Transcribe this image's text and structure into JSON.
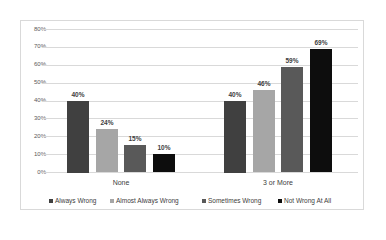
{
  "chart_data": {
    "type": "bar",
    "title": "",
    "xlabel": "",
    "ylabel": "",
    "categories": [
      "None",
      "3 or More"
    ],
    "series": [
      {
        "name": "Always Wrong",
        "color": "#404040",
        "values": [
          40,
          40
        ],
        "labels": [
          "40%",
          "40%"
        ]
      },
      {
        "name": "Almost Always Wrong",
        "color": "#a6a6a6",
        "values": [
          24,
          46
        ],
        "labels": [
          "24%",
          "46%"
        ]
      },
      {
        "name": "Sometimes Wrong",
        "color": "#595959",
        "values": [
          15,
          59
        ],
        "labels": [
          "15%",
          "59%"
        ]
      },
      {
        "name": "Not Wrong At All",
        "color": "#0d0d0d",
        "values": [
          10,
          69
        ],
        "labels": [
          "10%",
          "69%"
        ]
      }
    ],
    "ylim": [
      0,
      80
    ],
    "yticks": [
      "0%",
      "10%",
      "20%",
      "30%",
      "40%",
      "50%",
      "60%",
      "70%",
      "80%"
    ],
    "grid": true,
    "legend_position": "bottom"
  }
}
